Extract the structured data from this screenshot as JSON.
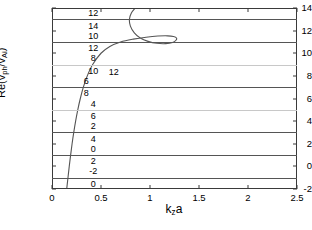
{
  "chart_data": {
    "type": "line",
    "title": "",
    "xlabel": "k_z a",
    "ylabel": "Re(v_ph/v_Ai)",
    "xlim": [
      0,
      2.5
    ],
    "ylim": [
      -2,
      14
    ],
    "grid": false,
    "legend": null,
    "xticks": [
      "0",
      "0.5",
      "1",
      "1.5",
      "2",
      "2.5"
    ],
    "xtick_values": [
      0,
      0.5,
      1,
      1.5,
      2,
      2.5
    ],
    "yticks": [
      "14",
      "12",
      "10",
      "8",
      "6",
      "4",
      "2",
      "0",
      "-2"
    ],
    "ytick_values": [
      14,
      12,
      10,
      8,
      6,
      4,
      2,
      0,
      -2
    ],
    "horizontal_lines": [
      {
        "y": 13,
        "shade": "dark"
      },
      {
        "y": 11,
        "shade": "dark"
      },
      {
        "y": 9,
        "shade": "light"
      },
      {
        "y": 7,
        "shade": "dark"
      },
      {
        "y": 5,
        "shade": "light"
      },
      {
        "y": 3,
        "shade": "dark"
      },
      {
        "y": 1,
        "shade": "dark"
      },
      {
        "y": -1,
        "shade": "dark"
      }
    ],
    "pair_labels": [
      {
        "x": 0.42,
        "y": 13.55,
        "text": "12"
      },
      {
        "x": 0.42,
        "y": 12.45,
        "text": "14"
      },
      {
        "x": 0.42,
        "y": 11.55,
        "text": "10"
      },
      {
        "x": 0.42,
        "y": 10.45,
        "text": "12"
      },
      {
        "x": 0.42,
        "y": 9.55,
        "text": "8"
      },
      {
        "x": 0.42,
        "y": 8.45,
        "text": "10"
      },
      {
        "x": 0.35,
        "y": 7.55,
        "text": "6"
      },
      {
        "x": 0.35,
        "y": 6.45,
        "text": "8"
      },
      {
        "x": 0.42,
        "y": 5.55,
        "text": "4"
      },
      {
        "x": 0.42,
        "y": 4.45,
        "text": "6"
      },
      {
        "x": 0.42,
        "y": 3.55,
        "text": "2"
      },
      {
        "x": 0.42,
        "y": 2.45,
        "text": "4"
      },
      {
        "x": 0.42,
        "y": 1.55,
        "text": "0"
      },
      {
        "x": 0.42,
        "y": 0.45,
        "text": "2"
      },
      {
        "x": 0.42,
        "y": -0.45,
        "text": "-2"
      },
      {
        "x": 0.42,
        "y": -1.55,
        "text": "0"
      }
    ],
    "annotations": [
      {
        "x": 0.63,
        "y": 8.3,
        "text": "12"
      }
    ],
    "series": [
      {
        "name": "dispersion-branch",
        "points": [
          [
            0.15,
            -2.0
          ],
          [
            0.163,
            -1.0
          ],
          [
            0.176,
            0.0
          ],
          [
            0.19,
            1.0
          ],
          [
            0.205,
            2.0
          ],
          [
            0.222,
            3.0
          ],
          [
            0.241,
            4.0
          ],
          [
            0.263,
            5.0
          ],
          [
            0.289,
            6.0
          ],
          [
            0.32,
            7.0
          ],
          [
            0.36,
            8.0
          ],
          [
            0.415,
            9.0
          ],
          [
            0.5,
            10.0
          ],
          [
            0.59,
            10.6
          ],
          [
            0.7,
            11.0
          ],
          [
            0.83,
            11.25
          ],
          [
            0.96,
            11.42
          ],
          [
            1.08,
            11.52
          ],
          [
            1.18,
            11.54
          ],
          [
            1.24,
            11.48
          ],
          [
            1.27,
            11.35
          ],
          [
            1.265,
            11.15
          ],
          [
            1.23,
            10.95
          ],
          [
            1.16,
            10.85
          ],
          [
            1.07,
            10.88
          ],
          [
            0.98,
            11.05
          ],
          [
            0.9,
            11.35
          ],
          [
            0.84,
            11.8
          ],
          [
            0.8,
            12.4
          ],
          [
            0.79,
            13.0
          ],
          [
            0.81,
            13.55
          ],
          [
            0.85,
            14.0
          ]
        ]
      }
    ]
  },
  "axis_titles": {
    "x_main": "k",
    "x_sub": "z",
    "x_tail": "a",
    "y_prefix": "Re(v",
    "y_sub1": "ph",
    "y_mid": "/v",
    "y_sub2": "Ai",
    "y_suffix": ")"
  },
  "colors": {
    "curve": "#555555",
    "line_dark": "#555555",
    "line_light": "#c8c8c8",
    "frame": "#3a3a3a",
    "background": "#ffffff",
    "text": "#000000"
  }
}
